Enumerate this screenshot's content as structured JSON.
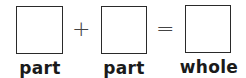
{
  "equation": {
    "operators": [
      "+",
      "="
    ],
    "terms": [
      {
        "label": "part",
        "value": ""
      },
      {
        "label": "part",
        "value": ""
      },
      {
        "label": "whole",
        "value": ""
      }
    ]
  }
}
